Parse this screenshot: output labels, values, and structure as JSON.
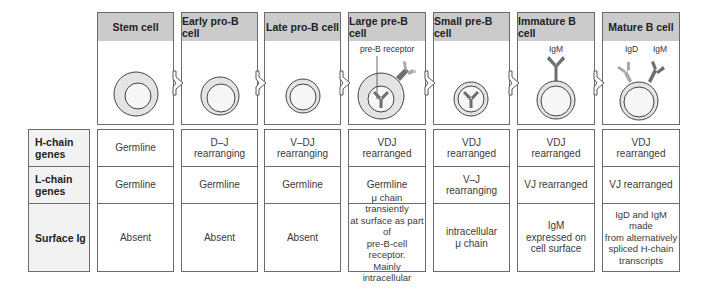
{
  "row_labels": [
    {
      "id": "h-chain",
      "line1": "H-chain",
      "line2": "genes"
    },
    {
      "id": "l-chain",
      "line1": "L-chain",
      "line2": "genes"
    },
    {
      "id": "surface-ig",
      "line1": "Surface  Ig",
      "line2": ""
    }
  ],
  "stages": [
    {
      "title": "Stem cell",
      "h": [
        "Germline",
        ""
      ],
      "l": [
        "Germline",
        ""
      ],
      "s": [
        "Absent",
        "",
        "",
        ""
      ]
    },
    {
      "title": "Early pro-B cell",
      "h": [
        "D–J",
        "rearranging"
      ],
      "l": [
        "Germline",
        ""
      ],
      "s": [
        "Absent",
        "",
        "",
        ""
      ]
    },
    {
      "title": "Late  pro-B cell",
      "h": [
        "V–DJ",
        "rearranging"
      ],
      "l": [
        "Germline",
        ""
      ],
      "s": [
        "Absent",
        "",
        "",
        ""
      ]
    },
    {
      "title": "Large pre-B cell",
      "h": [
        "VDJ",
        "rearranged"
      ],
      "l": [
        "Germline",
        ""
      ],
      "s": [
        "μ chain transiently",
        "at surface as part of",
        "pre-B-cell receptor.",
        "Mainly intracellular"
      ]
    },
    {
      "title": "Small pre-B cell",
      "h": [
        "VDJ",
        "rearranged"
      ],
      "l": [
        "V–J",
        "rearranging"
      ],
      "s": [
        "intracellular",
        "μ chain",
        "",
        ""
      ]
    },
    {
      "title": "Immature B cell",
      "h": [
        "VDJ",
        "rearranged"
      ],
      "l": [
        "VJ  rearranged",
        ""
      ],
      "s": [
        "IgM",
        "expressed  on",
        "cell  surface",
        ""
      ]
    },
    {
      "title": "Mature B cell",
      "h": [
        "VDJ",
        "rearranged"
      ],
      "l": [
        "VJ  rearranged",
        ""
      ],
      "s": [
        "IgD and IgM made",
        "from alternatively",
        "spliced H-chain",
        "transcripts"
      ]
    }
  ],
  "annotations": {
    "pre_b_receptor": "pre-B receptor",
    "igm_immature": "IgM",
    "igd_mature": "IgD",
    "igm_mature": "IgM"
  },
  "colors": {
    "header_bg": "#cbcbcb",
    "border": "#6b6b6b",
    "cytoplasm": "#e4e4e4",
    "nucleus": "#f4f4f4",
    "ig_dark": "#6e6e6e",
    "ig_light": "#a8a8a8"
  }
}
